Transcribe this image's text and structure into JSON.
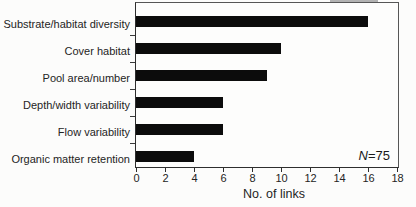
{
  "chart_data": {
    "type": "bar",
    "orientation": "horizontal",
    "title": "",
    "categories": [
      "Substrate/habitat diversity",
      "Cover habitat",
      "Pool area/number",
      "Depth/width variability",
      "Flow variability",
      "Organic matter retention"
    ],
    "values": [
      16,
      10,
      9,
      6,
      6,
      4
    ],
    "xlabel": "No. of links",
    "x_ticks": [
      0,
      2,
      4,
      6,
      8,
      10,
      12,
      14,
      16,
      18
    ],
    "xlim": [
      0,
      18
    ],
    "annotation": {
      "symbol": "N",
      "text": "=75"
    },
    "grid": false,
    "legend": false,
    "bar_color": "#0c0c0c",
    "axis_color": "#2e2e2e",
    "frame_color": "#565656",
    "text_color": "#242424",
    "background": "#fcfcfb"
  }
}
